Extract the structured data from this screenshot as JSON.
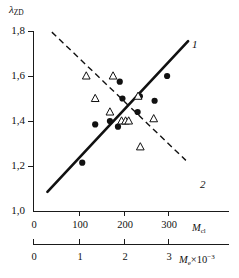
{
  "chart_data": {
    "type": "scatter",
    "title": "",
    "ylabel": "λ",
    "ylabel_sub": "ZD",
    "xlabel_primary": "M",
    "xlabel_primary_sub": "cl",
    "xlabel_secondary": "M",
    "xlabel_secondary_sub": "e",
    "xlabel_secondary_mult": "×10",
    "xlabel_secondary_exp": "−3",
    "ylim": [
      1.0,
      1.8
    ],
    "yticks": [
      "1,0",
      "1,2",
      "1,4",
      "1,6",
      "1,8"
    ],
    "ytick_values": [
      1.0,
      1.2,
      1.4,
      1.6,
      1.8
    ],
    "xlim_primary": [
      0,
      370
    ],
    "xticks_primary": [
      "0",
      "100",
      "200",
      "300"
    ],
    "xtick_values_primary": [
      0,
      100,
      200,
      300
    ],
    "xlim_secondary": [
      0,
      3.7
    ],
    "xticks_secondary": [
      "0",
      "1",
      "2",
      "3"
    ],
    "xtick_values_secondary": [
      0,
      1,
      2,
      3
    ],
    "grid": false,
    "legend": "none",
    "series": [
      {
        "name": "1",
        "marker": "filled-circle",
        "trend": "solid-line",
        "trend_label": "1",
        "trend_endpoints": [
          [
            30,
            1.085
          ],
          [
            345,
            1.755
          ]
        ],
        "points": [
          [
            108,
            1.215
          ],
          [
            137,
            1.385
          ],
          [
            170,
            1.4
          ],
          [
            188,
            1.375
          ],
          [
            192,
            1.575
          ],
          [
            198,
            1.5
          ],
          [
            232,
            1.44
          ],
          [
            237,
            1.51
          ],
          [
            270,
            1.49
          ],
          [
            298,
            1.6
          ]
        ]
      },
      {
        "name": "2",
        "marker": "open-triangle",
        "trend": "dashed-line",
        "trend_label": "2",
        "trend_endpoints": [
          [
            40,
            1.795
          ],
          [
            340,
            1.225
          ]
        ],
        "points": [
          [
            117,
            1.6
          ],
          [
            137,
            1.5
          ],
          [
            170,
            1.44
          ],
          [
            177,
            1.6
          ],
          [
            196,
            1.4
          ],
          [
            205,
            1.4
          ],
          [
            212,
            1.4
          ],
          [
            233,
            1.51
          ],
          [
            238,
            1.285
          ],
          [
            268,
            1.41
          ]
        ]
      }
    ]
  }
}
